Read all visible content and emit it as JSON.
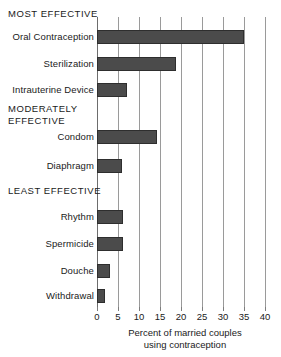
{
  "chart_data": {
    "type": "bar",
    "orientation": "horizontal",
    "title": "",
    "xlabel": "Percent of married couples using contraception",
    "ylabel": "",
    "xlim": [
      0,
      40
    ],
    "xticks": [
      0,
      5,
      10,
      15,
      20,
      25,
      30,
      35,
      40
    ],
    "grid": true,
    "legend": null,
    "bar_color": "#4b4b4b",
    "categories": [
      "Oral Contraception",
      "Sterilization",
      "Intrauterine Device",
      "Condom",
      "Diaphragm",
      "Rhythm",
      "Spermicide",
      "Douche",
      "Withdrawal"
    ],
    "values": [
      35.0,
      18.8,
      7.1,
      14.3,
      6.0,
      6.2,
      6.2,
      3.2,
      2.0
    ],
    "groups": [
      {
        "label": "MOST EFFECTIVE",
        "categories": [
          "Oral Contraception",
          "Sterilization",
          "Intrauterine Device"
        ]
      },
      {
        "label": "MODERATELY\nEFFECTIVE",
        "categories": [
          "Condom",
          "Diaphragm"
        ]
      },
      {
        "label": "LEAST EFFECTIVE",
        "categories": [
          "Rhythm",
          "Spermicide",
          "Douche",
          "Withdrawal"
        ]
      }
    ]
  },
  "axis": {
    "tick_labels": [
      "0",
      "5",
      "10",
      "15",
      "20",
      "25",
      "30",
      "35",
      "40"
    ],
    "title_line1": "Percent of married couples",
    "title_line2": "using contraception"
  },
  "groups": {
    "most": "MOST EFFECTIVE",
    "moderately": "MODERATELY\nEFFECTIVE",
    "least": "LEAST EFFECTIVE"
  },
  "rows": [
    {
      "label": "Oral Contraception",
      "value": 35.0
    },
    {
      "label": "Sterilization",
      "value": 18.8
    },
    {
      "label": "Intrauterine Device",
      "value": 7.1
    },
    {
      "label": "Condom",
      "value": 14.3
    },
    {
      "label": "Diaphragm",
      "value": 6.0
    },
    {
      "label": "Rhythm",
      "value": 6.2
    },
    {
      "label": "Spermicide",
      "value": 6.2
    },
    {
      "label": "Douche",
      "value": 3.2
    },
    {
      "label": "Withdrawal",
      "value": 2.0
    }
  ]
}
